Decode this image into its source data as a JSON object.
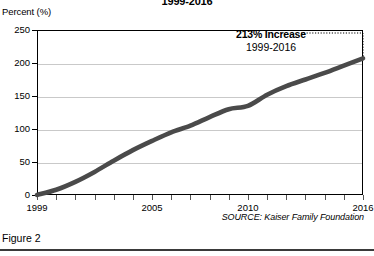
{
  "figure": {
    "caption": "Figure 2",
    "source_note": "SOURCE: Kaiser Family Foundation"
  },
  "chart_data": {
    "type": "line",
    "title": "1999-2016",
    "xlabel": "",
    "ylabel": "Percent (%)",
    "ylim": [
      0,
      250
    ],
    "xlim": [
      1999,
      2016
    ],
    "yticks": [
      0,
      50,
      100,
      150,
      200,
      250
    ],
    "xticks": [
      1999,
      2000,
      2001,
      2002,
      2003,
      2004,
      2005,
      2006,
      2007,
      2008,
      2009,
      2010,
      2011,
      2012,
      2013,
      2014,
      2015,
      2016
    ],
    "xtick_labels": [
      "1999",
      "",
      "",
      "",
      "",
      "",
      "2005",
      "",
      "",
      "",
      "",
      "2010",
      "",
      "",
      "",
      "",
      "",
      "2016"
    ],
    "grid": true,
    "legend_position": "none",
    "line_color": "#4a4a4a",
    "grid_color": "#c9c9c9",
    "x": [
      1999,
      2000,
      2001,
      2002,
      2003,
      2004,
      2005,
      2006,
      2007,
      2008,
      2009,
      2010,
      2011,
      2012,
      2013,
      2014,
      2015,
      2016
    ],
    "values": [
      0,
      8,
      20,
      35,
      52,
      68,
      82,
      95,
      105,
      118,
      130,
      135,
      152,
      165,
      175,
      185,
      196,
      207
    ],
    "series": [
      {
        "name": "Cumulative premium increase",
        "values": [
          0,
          8,
          20,
          35,
          52,
          68,
          82,
          95,
          105,
          118,
          130,
          135,
          152,
          165,
          175,
          185,
          196,
          207
        ]
      }
    ],
    "annotations": [
      {
        "name": "increase-callout",
        "main": "213% Increase",
        "sub": "1999-2016",
        "leader": "dotted"
      }
    ]
  }
}
